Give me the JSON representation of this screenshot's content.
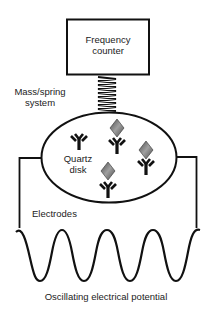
{
  "diagram": {
    "labels": {
      "frequency_counter_line1": "Frequency",
      "frequency_counter_line2": "counter",
      "mass_spring_line1": "Mass/spring",
      "mass_spring_line2": "system",
      "quartz_line1": "Quartz",
      "quartz_line2": "disk",
      "electrodes": "Electrodes",
      "oscillating": "Oscillating electrical potential"
    },
    "components": [
      {
        "id": "frequency-counter",
        "shape": "rectangle"
      },
      {
        "id": "spring",
        "shape": "coil"
      },
      {
        "id": "quartz-disk",
        "shape": "ellipse"
      },
      {
        "id": "electrode-left",
        "shape": "wire"
      },
      {
        "id": "electrode-right",
        "shape": "wire"
      },
      {
        "id": "sine-wave",
        "shape": "wave"
      }
    ],
    "antibodies": [
      {
        "id": "antibody-1",
        "has_antigen": false
      },
      {
        "id": "antibody-2",
        "has_antigen": true
      },
      {
        "id": "antibody-3",
        "has_antigen": true
      },
      {
        "id": "antibody-4",
        "has_antigen": true
      }
    ],
    "colors": {
      "stroke": "#111111",
      "antigen_dark": "#4a4a4a",
      "antigen_light": "#a0a0a0",
      "text": "#222222"
    }
  }
}
